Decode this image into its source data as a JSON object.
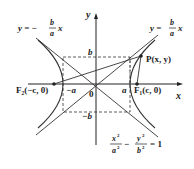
{
  "diagram": {
    "equation": {
      "x_num": "x",
      "x_den": "a",
      "y_num": "y",
      "y_den": "b",
      "sup": "2",
      "rhs": "= 1",
      "minus": "−"
    },
    "asymptote_neg": {
      "lhs": "y = −",
      "num": "b",
      "den": "a",
      "var": "x"
    },
    "asymptote_pos": {
      "lhs": "y =",
      "num": "b",
      "den": "a",
      "var": "x"
    },
    "labels": {
      "x_axis": "x",
      "y_axis": "y",
      "origin": "0",
      "a": "a",
      "neg_a": "−a",
      "b": "b",
      "neg_b": "−b",
      "F1": "F₁(c, 0)",
      "F2": "F₂(−c, 0)",
      "P": "P(x, y)"
    },
    "colors": {
      "curve": "#333333",
      "axis": "#222222",
      "dashed": "#333333"
    }
  }
}
